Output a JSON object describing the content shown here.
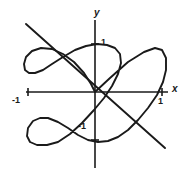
{
  "figure": {
    "background_color": "#ffffff",
    "ink_color": "#1a1a1a",
    "width": 188,
    "height": 175
  },
  "axes": {
    "x_label": "x",
    "y_label": "y",
    "origin_px": [
      95,
      92
    ],
    "x_axis_from_px": [
      26,
      92
    ],
    "x_axis_to_px": [
      168,
      92
    ],
    "y_axis_from_px": [
      95,
      20
    ],
    "y_axis_to_px": [
      95,
      168
    ],
    "ticks": {
      "x_positive": "1",
      "x_negative": "-1",
      "y_positive": "1",
      "y_negative": "-1"
    },
    "tick_positions_px": {
      "x_positive": 162,
      "x_negative": 28,
      "y_positive": 44,
      "y_negative": 140
    },
    "unit_px": 67
  },
  "chart_data": {
    "type": "line",
    "xlabel": "x",
    "ylabel": "y",
    "xlim": [
      -1.35,
      1.25
    ],
    "ylim": [
      -1.2,
      1.15
    ],
    "grid": false,
    "legend": null,
    "x_ticks": [
      -1,
      1
    ],
    "x_tick_labels": [
      "-1",
      "1"
    ],
    "y_ticks": [
      -1,
      1
    ],
    "y_tick_labels": [
      "-1",
      "1"
    ],
    "series": [
      {
        "name": "closed-curve",
        "kind": "closed_parametric",
        "description": "Butterfly / Lissajous-style closed loop, two lobes crossing near the origin",
        "closed": true,
        "points_px": [
          [
            95,
            92
          ],
          [
            110,
            78
          ],
          [
            128,
            62
          ],
          [
            144,
            52
          ],
          [
            155,
            48
          ],
          [
            162,
            50
          ],
          [
            166,
            58
          ],
          [
            166,
            70
          ],
          [
            163,
            82
          ],
          [
            157,
            95
          ],
          [
            148,
            108
          ],
          [
            138,
            120
          ],
          [
            128,
            130
          ],
          [
            118,
            137
          ],
          [
            108,
            141
          ],
          [
            98,
            142
          ],
          [
            88,
            140
          ],
          [
            78,
            135
          ],
          [
            68,
            128
          ],
          [
            58,
            122
          ],
          [
            48,
            118
          ],
          [
            40,
            118
          ],
          [
            33,
            121
          ],
          [
            28,
            128
          ],
          [
            27,
            136
          ],
          [
            30,
            142
          ],
          [
            37,
            145
          ],
          [
            47,
            145
          ],
          [
            58,
            142
          ],
          [
            70,
            134
          ],
          [
            82,
            123
          ],
          [
            94,
            110
          ],
          [
            104,
            98
          ],
          [
            112,
            86
          ],
          [
            118,
            74
          ],
          [
            121,
            63
          ],
          [
            120,
            54
          ],
          [
            115,
            48
          ],
          [
            107,
            45
          ],
          [
            97,
            44
          ],
          [
            86,
            46
          ],
          [
            75,
            50
          ],
          [
            63,
            57
          ],
          [
            52,
            64
          ],
          [
            43,
            70
          ],
          [
            35,
            73
          ],
          [
            29,
            73
          ],
          [
            25,
            70
          ],
          [
            24,
            64
          ],
          [
            26,
            57
          ],
          [
            32,
            51
          ],
          [
            41,
            48
          ],
          [
            52,
            49
          ],
          [
            63,
            54
          ],
          [
            74,
            62
          ],
          [
            84,
            73
          ],
          [
            91,
            84
          ],
          [
            95,
            92
          ]
        ]
      },
      {
        "name": "diagonal-line",
        "kind": "straight_line",
        "description": "Straight line of negative slope passing through the origin",
        "from_px": [
          26,
          24
        ],
        "to_px": [
          165,
          148
        ]
      }
    ]
  }
}
